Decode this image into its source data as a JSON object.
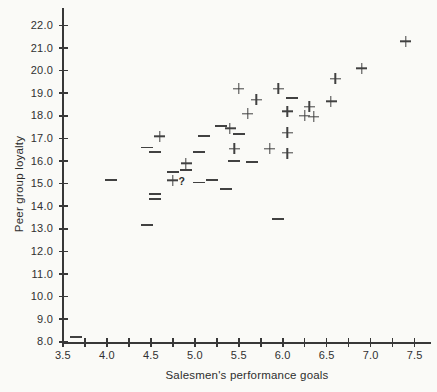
{
  "figure": {
    "background_color": "#fafaf7",
    "ink_color": "#414141"
  },
  "chart_data": {
    "type": "scatter",
    "title": "",
    "xlabel": "Salesmen's performance goals",
    "ylabel": "Peer group loyalty",
    "xlim": [
      3.5,
      7.7
    ],
    "ylim": [
      8.0,
      22.8
    ],
    "grid": false,
    "legend": "none",
    "x_tick_values": [
      3.5,
      4.0,
      4.5,
      5.0,
      5.5,
      6.0,
      6.5,
      7.0,
      7.5
    ],
    "x_tick_labels": [
      "3.5",
      "4.0",
      "4.5",
      "5.0",
      "5.5",
      "6.0",
      "6.5",
      "7.0",
      "7.5"
    ],
    "x_minor_tick_step": 0.25,
    "y_tick_values": [
      22,
      21,
      20,
      19,
      18,
      17,
      16,
      15,
      14,
      13,
      12,
      11,
      10,
      9,
      8
    ],
    "y_tick_labels": [
      "22.0",
      "21.0",
      "20.0",
      "19.0",
      "18.0",
      "17.0",
      "16.0",
      "15.0",
      "14.0",
      "13.0",
      "12.0",
      "11.0",
      "10.0",
      "9.0",
      "8.0"
    ],
    "series": [
      {
        "name": "plus",
        "marker": "plus",
        "glyph": "+",
        "points": [
          [
            4.6,
            17.1
          ],
          [
            5.4,
            17.45
          ],
          [
            4.9,
            15.9
          ],
          [
            4.75,
            15.15
          ],
          [
            5.5,
            19.2
          ],
          [
            5.7,
            18.7
          ],
          [
            5.6,
            18.1
          ],
          [
            5.95,
            19.2
          ],
          [
            6.05,
            18.2
          ],
          [
            6.3,
            18.4
          ],
          [
            6.25,
            18.0
          ],
          [
            6.35,
            17.95
          ],
          [
            6.05,
            17.25
          ],
          [
            5.45,
            16.55
          ],
          [
            5.85,
            16.55
          ],
          [
            6.05,
            16.35
          ],
          [
            6.55,
            18.65
          ],
          [
            6.6,
            19.65
          ],
          [
            6.9,
            20.1
          ],
          [
            7.4,
            21.3
          ]
        ]
      },
      {
        "name": "minus",
        "marker": "minus",
        "glyph": "−",
        "points": [
          [
            4.45,
            16.6
          ],
          [
            4.55,
            16.4
          ],
          [
            5.1,
            17.1
          ],
          [
            5.05,
            16.4
          ],
          [
            5.3,
            17.55
          ],
          [
            5.5,
            17.2
          ],
          [
            4.9,
            15.6
          ],
          [
            4.75,
            15.5
          ],
          [
            5.05,
            15.05
          ],
          [
            5.2,
            15.15
          ],
          [
            4.05,
            15.15
          ],
          [
            4.55,
            14.55
          ],
          [
            4.55,
            14.3
          ],
          [
            5.35,
            14.75
          ],
          [
            4.45,
            13.15
          ],
          [
            3.65,
            8.2
          ],
          [
            6.1,
            18.8
          ],
          [
            5.45,
            16.0
          ],
          [
            5.65,
            15.95
          ],
          [
            5.95,
            13.45
          ]
        ]
      }
    ],
    "annotations": [
      {
        "text": "?",
        "x": 4.85,
        "y": 15.1
      }
    ]
  }
}
